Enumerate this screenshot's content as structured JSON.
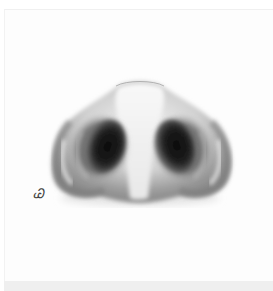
{
  "image": {
    "subject": "Pencil drawing of a nose viewed from below showing nostrils",
    "signature": "Ꮚ"
  },
  "colors": {
    "paper": "#fdfdfd",
    "skin_light": "#f4f4f4",
    "skin_mid": "#a8a8a8",
    "shadow": "#6e6e6e",
    "nostril": "#111111"
  }
}
